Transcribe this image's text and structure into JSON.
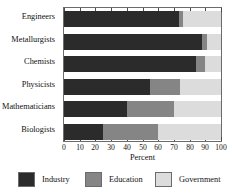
{
  "chart_data": {
    "type": "bar",
    "orientation": "horizontal",
    "stacked": true,
    "title": "",
    "xlabel": "Percent",
    "ylabel": "",
    "xlim": [
      0,
      100
    ],
    "xticks": [
      0,
      10,
      20,
      30,
      40,
      50,
      60,
      70,
      80,
      90,
      100
    ],
    "xtick_labels": [
      "0",
      "10",
      "20",
      "30",
      "40",
      "50",
      "60",
      "70",
      "80",
      "90",
      "100"
    ],
    "grid": false,
    "legend_position": "bottom",
    "categories": [
      "Engineers",
      "Metallurgists",
      "Chemists",
      "Physicists",
      "Mathematicians",
      "Biologists"
    ],
    "series": [
      {
        "name": "Industry",
        "color": "#2b2b2b",
        "values": [
          73,
          88,
          84,
          55,
          40,
          25
        ]
      },
      {
        "name": "Education",
        "color": "#858585",
        "values": [
          3,
          3,
          6,
          19,
          30,
          35
        ]
      },
      {
        "name": "Government",
        "color": "#dcdcdc",
        "values": [
          24,
          9,
          10,
          26,
          30,
          40
        ]
      }
    ]
  },
  "axis": {
    "xlabel": "Percent"
  },
  "legend": {
    "items": [
      {
        "label": "Industry"
      },
      {
        "label": "Education"
      },
      {
        "label": "Government"
      }
    ]
  }
}
